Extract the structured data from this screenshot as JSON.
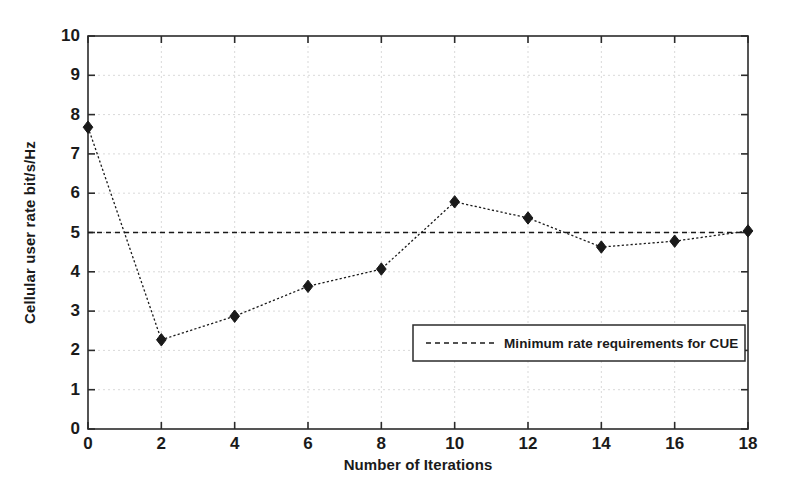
{
  "chart_data": {
    "type": "line",
    "title": "",
    "xlabel": "Number of Iterations",
    "ylabel": "Cellular user rate bit/s/Hz",
    "xlim": [
      0,
      18
    ],
    "ylim": [
      0,
      10
    ],
    "xticks": [
      0,
      2,
      4,
      6,
      8,
      10,
      12,
      14,
      16,
      18
    ],
    "yticks": [
      0,
      1,
      2,
      3,
      4,
      5,
      6,
      7,
      8,
      9,
      10
    ],
    "grid": true,
    "grid_style": "dotted",
    "legend_position": "center-right-inside",
    "series": [
      {
        "name": "Cellular user rate",
        "style": "dotted-line-with-diamond-markers",
        "marker": "diamond",
        "color": "#1a1a1a",
        "in_legend": false,
        "x": [
          0,
          2,
          4,
          6,
          8,
          10,
          12,
          14,
          16,
          18
        ],
        "values": [
          7.68,
          2.27,
          2.87,
          3.63,
          4.07,
          5.78,
          5.37,
          4.63,
          4.78,
          5.04
        ]
      },
      {
        "name": "Minimum rate requirements for CUE",
        "style": "dashed-horizontal-reference-line",
        "marker": "none",
        "color": "#1a1a1a",
        "in_legend": true,
        "x": [
          0,
          18
        ],
        "values": [
          5.0,
          5.0
        ]
      }
    ],
    "legend_entries": [
      {
        "label": "Minimum rate requirements for CUE",
        "style": "dashed"
      }
    ]
  },
  "colors": {
    "axis": "#2b2b2b",
    "grid": "#d9d9d9",
    "data": "#1a1a1a",
    "background": "#ffffff"
  }
}
